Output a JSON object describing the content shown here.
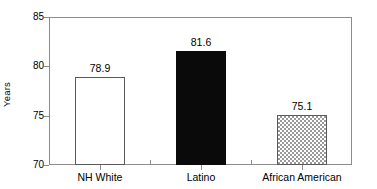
{
  "chart_data": {
    "type": "bar",
    "title": "",
    "subtitle": "",
    "xlabel": "",
    "ylabel": "Years",
    "categories": [
      "NH White",
      "Latino",
      "African American"
    ],
    "values": [
      78.9,
      81.6,
      75.1
    ],
    "value_labels": [
      "78.9",
      "81.6",
      "75.1"
    ],
    "ylim": [
      70,
      85
    ],
    "yticks": [
      70,
      75,
      80,
      85
    ],
    "ytick_labels": [
      "70",
      "75",
      "80",
      "85"
    ],
    "grid": false,
    "legend": false,
    "legend_position": "none",
    "bar_styles": [
      "white-outlined",
      "solid-black",
      "gray-checkerboard"
    ],
    "series": [
      {
        "name": "Life expectancy",
        "values": [
          78.9,
          81.6,
          75.1
        ]
      }
    ],
    "colors": {
      "bar_white_fill": "#ffffff",
      "bar_black_fill": "#0a0a0a",
      "bar_checker_fill": "#9a9a9a",
      "bar_outline": "#5a5a5a",
      "axis": "#8c8c8c",
      "text": "#000000",
      "background": "#ffffff"
    }
  },
  "axis": {
    "y_title": "Years"
  }
}
